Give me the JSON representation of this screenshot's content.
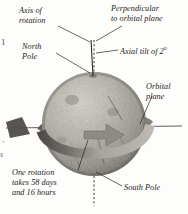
{
  "labels": {
    "axis_of_rotation": "Axis of\nrotation",
    "perpendicular": "Perpendicular\nto orbital plane",
    "axial_tilt_prefix": "Axial tilt of",
    "axial_tilt_value": "2",
    "axial_tilt_degree": "o",
    "north_pole": "North\nPole",
    "south_pole": "South Pole",
    "orbital_plane": "Orbital\nplane",
    "rotation_note": "One rotation\ntakes 58 days\nand 16 hours"
  },
  "margin": {
    "page_number": "1",
    "fragment_top": "'",
    "fragment_bottom": "s"
  },
  "colors": {
    "ink": "#1d1b19",
    "paper": "#fdfdfc",
    "planet_light": "#c9c5bd",
    "planet_mid": "#9e9a92",
    "planet_dark": "#6d6a64",
    "band_dark": "#565350",
    "band_light": "#b6b2ab",
    "leader_line": "#2a2724"
  },
  "geometry": {
    "sphere_center_x": 94,
    "sphere_center_y": 124,
    "sphere_radius": 52,
    "tilt_degrees": 2
  }
}
